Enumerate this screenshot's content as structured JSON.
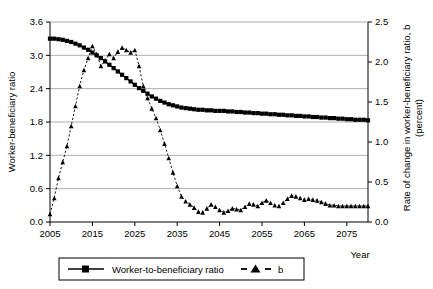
{
  "chart_data": {
    "type": "line",
    "title": "",
    "xlabel": "Year",
    "ylabel": "Worker-beneficiary ratio",
    "y2label": "Rate of change in worker-beneficiary ratio, b (percent)",
    "xlim": [
      2005,
      2080
    ],
    "ylim": [
      0.0,
      3.6
    ],
    "y2lim": [
      0.0,
      2.5
    ],
    "grid": true,
    "legend_position": "bottom",
    "xticks": [
      2005,
      2015,
      2025,
      2035,
      2045,
      2055,
      2065,
      2075
    ],
    "xtick_labels": [
      "2005",
      "2015",
      "2025",
      "2035",
      "2045",
      "2055",
      "2065",
      "2075"
    ],
    "yticks": [
      0.0,
      0.6,
      1.2,
      1.8,
      2.4,
      3.0,
      3.6
    ],
    "ytick_labels": [
      "0.0",
      "0.6",
      "1.2",
      "1.8",
      "2.4",
      "3.0",
      "3.6"
    ],
    "y2ticks": [
      0.0,
      0.5,
      1.0,
      1.5,
      2.0,
      2.5
    ],
    "y2tick_labels": [
      "0.0",
      "0.5",
      "1.0",
      "1.5",
      "2.0",
      "2.5"
    ],
    "x": [
      2005,
      2006,
      2007,
      2008,
      2009,
      2010,
      2011,
      2012,
      2013,
      2014,
      2015,
      2016,
      2017,
      2018,
      2019,
      2020,
      2021,
      2022,
      2023,
      2024,
      2025,
      2026,
      2027,
      2028,
      2029,
      2030,
      2031,
      2032,
      2033,
      2034,
      2035,
      2036,
      2037,
      2038,
      2039,
      2040,
      2041,
      2042,
      2043,
      2044,
      2045,
      2046,
      2047,
      2048,
      2049,
      2050,
      2051,
      2052,
      2053,
      2054,
      2055,
      2056,
      2057,
      2058,
      2059,
      2060,
      2061,
      2062,
      2063,
      2064,
      2065,
      2066,
      2067,
      2068,
      2069,
      2070,
      2071,
      2072,
      2073,
      2074,
      2075,
      2076,
      2077,
      2078,
      2079,
      2080
    ],
    "series": [
      {
        "name": "Worker-to-beneficiary ratio",
        "axis": "left",
        "marker": "square",
        "linestyle": "solid",
        "color": "#000000",
        "values": [
          3.3,
          3.3,
          3.29,
          3.28,
          3.26,
          3.24,
          3.21,
          3.18,
          3.14,
          3.1,
          3.05,
          3.0,
          2.95,
          2.89,
          2.83,
          2.77,
          2.71,
          2.65,
          2.59,
          2.53,
          2.47,
          2.41,
          2.36,
          2.31,
          2.26,
          2.22,
          2.18,
          2.15,
          2.12,
          2.1,
          2.08,
          2.06,
          2.05,
          2.04,
          2.03,
          2.02,
          2.02,
          2.01,
          2.01,
          2.0,
          2.0,
          2.0,
          1.99,
          1.99,
          1.98,
          1.98,
          1.97,
          1.97,
          1.96,
          1.96,
          1.95,
          1.95,
          1.94,
          1.94,
          1.93,
          1.93,
          1.92,
          1.92,
          1.91,
          1.91,
          1.9,
          1.9,
          1.89,
          1.89,
          1.88,
          1.88,
          1.87,
          1.87,
          1.86,
          1.86,
          1.85,
          1.85,
          1.84,
          1.84,
          1.84,
          1.83
        ]
      },
      {
        "name": "b",
        "axis": "right",
        "marker": "triangle",
        "linestyle": "dashed",
        "color": "#000000",
        "values": [
          0.1,
          0.3,
          0.55,
          0.75,
          0.95,
          1.2,
          1.45,
          1.7,
          1.9,
          2.05,
          2.2,
          2.1,
          1.95,
          2.02,
          2.1,
          2.05,
          2.13,
          2.18,
          2.15,
          2.12,
          2.15,
          1.95,
          1.7,
          1.55,
          1.42,
          1.3,
          1.15,
          0.98,
          0.8,
          0.62,
          0.45,
          0.32,
          0.26,
          0.22,
          0.18,
          0.13,
          0.12,
          0.17,
          0.22,
          0.19,
          0.15,
          0.12,
          0.14,
          0.17,
          0.16,
          0.15,
          0.19,
          0.23,
          0.22,
          0.2,
          0.24,
          0.27,
          0.24,
          0.21,
          0.2,
          0.24,
          0.29,
          0.33,
          0.32,
          0.3,
          0.28,
          0.29,
          0.28,
          0.27,
          0.25,
          0.23,
          0.21,
          0.21,
          0.2,
          0.2,
          0.2,
          0.2,
          0.2,
          0.2,
          0.2,
          0.2
        ]
      }
    ],
    "legend": [
      {
        "label": "Worker-to-beneficiary ratio",
        "marker": "square",
        "linestyle": "solid"
      },
      {
        "label": "b",
        "marker": "triangle",
        "linestyle": "dashed"
      }
    ]
  }
}
